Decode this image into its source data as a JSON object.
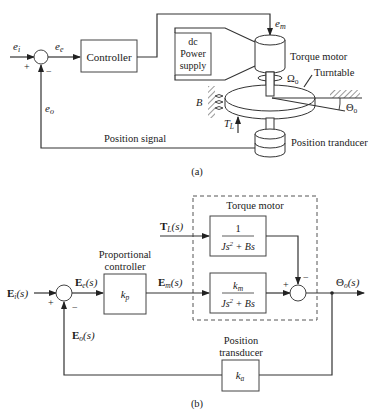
{
  "figure_a": {
    "caption": "(a)",
    "signals": {
      "input": "e",
      "input_sub": "i",
      "error": "e",
      "error_sub": "e",
      "feedback": "e",
      "feedback_sub": "o",
      "motor_input": "e",
      "motor_input_sub": "m"
    },
    "controller_label": "Controller",
    "power_supply_lines": [
      "dc",
      "Power",
      "supply"
    ],
    "torque_motor_label": "Torque motor",
    "turntable_label": "Turntable",
    "omega_label": "Ω",
    "omega_sub": "o",
    "theta_label": "Θ",
    "theta_sub": "o",
    "damping_label": "B",
    "load_torque_label": "T",
    "load_torque_sub": "L",
    "position_signal_label": "Position signal",
    "position_transducer_label": "Position tranducer",
    "plus": "+",
    "minus": "−"
  },
  "figure_b": {
    "caption": "(b)",
    "input_label": "E",
    "input_sub": "i",
    "input_arg": "(s)",
    "error_label": "E",
    "error_sub": "e",
    "error_arg": "(s)",
    "feedback_label": "E",
    "feedback_sub": "o",
    "feedback_arg": "(s)",
    "motor_input_label": "E",
    "motor_input_sub": "m",
    "motor_input_arg": "(s)",
    "load_label": "T",
    "load_sub": "L",
    "load_arg": "(s)",
    "output_label": "Θ",
    "output_sub": "o",
    "output_arg": "(s)",
    "controller_title_lines": [
      "Proportional",
      "controller"
    ],
    "controller_gain": "k",
    "controller_gain_sub": "p",
    "torque_motor_title": "Torque motor",
    "load_tf_num": "1",
    "load_tf_den_a": "Js",
    "load_tf_den_exp": "2",
    "load_tf_den_b": " + Bs",
    "motor_tf_num": "k",
    "motor_tf_num_sub": "m",
    "motor_tf_den_a": "Js",
    "motor_tf_den_exp": "2",
    "motor_tf_den_b": " + Bs",
    "transducer_title_lines": [
      "Position",
      "transducer"
    ],
    "transducer_gain": "k",
    "transducer_gain_sub": "a",
    "plus": "+",
    "minus": "−"
  }
}
